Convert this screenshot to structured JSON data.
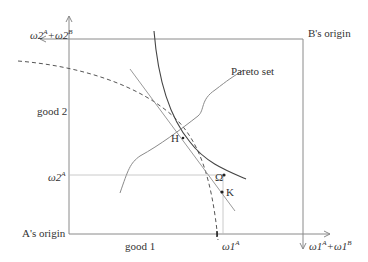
{
  "diagram": {
    "type": "edgeworth-box",
    "labels": {
      "a_origin": "A's origin",
      "b_origin": "B's origin",
      "good1": "good 1",
      "good2": "good 2",
      "pareto_set": "Pareto set",
      "point_h": "H",
      "point_omega": "Ω",
      "point_k": "K",
      "omega2_total_base": "ω2",
      "omega2_total_sup1": "A",
      "omega2_total_mid": "+ω2",
      "omega2_total_sup2": "B",
      "omega2_a_base": "ω2",
      "omega2_a_sup": "A",
      "omega1_a_base": "ω1",
      "omega1_a_sup": "A",
      "omega1_total_base": "ω1",
      "omega1_total_sup1": "A",
      "omega1_total_mid": "+ω1",
      "omega1_total_sup2": "B"
    },
    "colors": {
      "axis": "#8a8a8a",
      "curve": "#444444",
      "tangent": "#9a9a9a",
      "dashed": "#555555",
      "text": "#333333"
    }
  }
}
